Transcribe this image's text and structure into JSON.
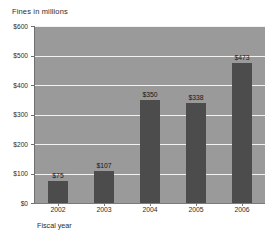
{
  "chart_data": {
    "type": "bar",
    "title": "Fines in millions",
    "xlabel": "Fiscal year",
    "ylabel": "",
    "categories": [
      "2002",
      "2003",
      "2004",
      "2005",
      "2006"
    ],
    "values": [
      75,
      107,
      350,
      338,
      473
    ],
    "value_labels": [
      "$75",
      "$107",
      "$350",
      "$338",
      "$473"
    ],
    "ylim": [
      0,
      600
    ],
    "ytick_values": [
      0,
      100,
      200,
      300,
      400,
      500,
      600
    ],
    "ytick_labels": [
      "$0",
      "$100",
      "$200",
      "$300",
      "$400",
      "$500",
      "$600"
    ],
    "grid": true,
    "grid_orientation": "horizontal",
    "legend": false,
    "colors": {
      "bar": "#4c4c4c",
      "plot_background": "#9a9a9a",
      "gridline": "#f2f2f2",
      "page_background": "#ffffff",
      "text": "#2b2b2b"
    }
  }
}
